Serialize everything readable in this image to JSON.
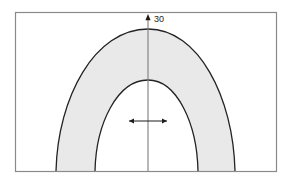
{
  "figure": {
    "canvas": {
      "width": 290,
      "height": 186,
      "background": "#ffffff"
    },
    "frame": {
      "name": "figure-border",
      "x": 15.5,
      "y": 12.5,
      "width": 261,
      "height": 159,
      "stroke": "#8a8a8a",
      "stroke_width": 1.2,
      "fill": "none"
    },
    "band": {
      "name": "shaded-band",
      "fill": "#e9e9e9",
      "stroke": "#222222",
      "stroke_width": 1.3
    },
    "outer_curve": {
      "name": "outer-parabola",
      "apex_x": 148,
      "apex_y": 29,
      "left_base_x": 56,
      "right_base_x": 235,
      "base_y": 171
    },
    "inner_curve": {
      "name": "inner-parabola",
      "apex_x": 148,
      "apex_y": 80,
      "left_base_x": 95,
      "right_base_x": 198,
      "base_y": 171
    },
    "vertical_axis": {
      "name": "center-axis-line",
      "x": 148,
      "y_top": 20,
      "y_bottom": 171,
      "stroke": "#7d7d7d",
      "stroke_width": 1.1
    },
    "top_marker": {
      "name": "axis-top-arrow",
      "x": 148,
      "y": 18,
      "glyph": "up-arrow",
      "color": "#1c1c1c"
    },
    "top_label": {
      "name": "value-label-30",
      "text": "30",
      "x": 154,
      "y": 22,
      "color": "#1c1c1c",
      "font_size": 9
    },
    "width_arrow": {
      "name": "horizontal-double-arrow",
      "y": 121,
      "x_left": 129,
      "x_right": 167,
      "stroke": "#1c1c1c",
      "stroke_width": 1.1
    }
  },
  "chart_data": {
    "type": "area",
    "title": "",
    "xlabel": "",
    "ylabel": "",
    "grid": false,
    "legend": null,
    "annotations": [
      {
        "text": "30",
        "target": "outer-parabola-apex",
        "position": "top-center"
      },
      {
        "text": "",
        "target": "inner-parabola-width",
        "position": "mid-center",
        "style": "double-headed-arrow"
      }
    ],
    "series": [
      {
        "name": "outer boundary",
        "apex": [
          148,
          29
        ],
        "base_span": [
          56,
          235
        ],
        "shape": "parabola"
      },
      {
        "name": "inner boundary",
        "apex": [
          148,
          80
        ],
        "base_span": [
          95,
          198
        ],
        "shape": "parabola"
      }
    ],
    "shaded_region": "between outer and inner parabolas"
  }
}
